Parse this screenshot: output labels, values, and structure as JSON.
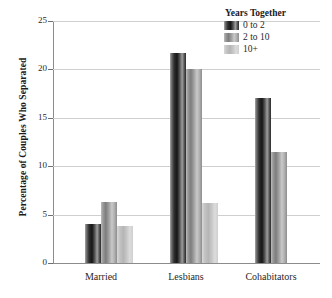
{
  "chart_data": {
    "type": "bar",
    "title": "",
    "xlabel": "",
    "ylabel": "Percentage of Couples Who Separated",
    "categories": [
      "Married",
      "Lesbians",
      "Cohabitators"
    ],
    "ylim": [
      0,
      25
    ],
    "yticks": [
      0,
      5,
      10,
      15,
      20,
      25
    ],
    "grid": true,
    "legend_position": "top-right",
    "legend_title": "Years Together",
    "series": [
      {
        "name": "0 to 2",
        "values": [
          4.0,
          21.7,
          17.0
        ]
      },
      {
        "name": "2 to 10",
        "values": [
          6.3,
          20.0,
          11.5
        ]
      },
      {
        "name": "10+",
        "values": [
          3.85,
          6.2,
          null
        ]
      }
    ],
    "colors": {
      "series_0": "#2e2e2e",
      "series_1": "#9a9a9a",
      "series_2": "#c8c8c8",
      "axis": "#8c8c8c",
      "grid": "#cfcfcf",
      "text": "#231f20"
    }
  },
  "axis": {
    "y_tick_labels": [
      "0",
      "5",
      "10",
      "15",
      "20",
      "25"
    ],
    "y_title": "Percentage of Couples Who Separated"
  },
  "legend": {
    "title": "Years Together",
    "items": [
      {
        "label": "0 to 2"
      },
      {
        "label": "2 to 10"
      },
      {
        "label": "10+"
      }
    ]
  },
  "x_labels": [
    "Married",
    "Lesbians",
    "Cohabitators"
  ]
}
